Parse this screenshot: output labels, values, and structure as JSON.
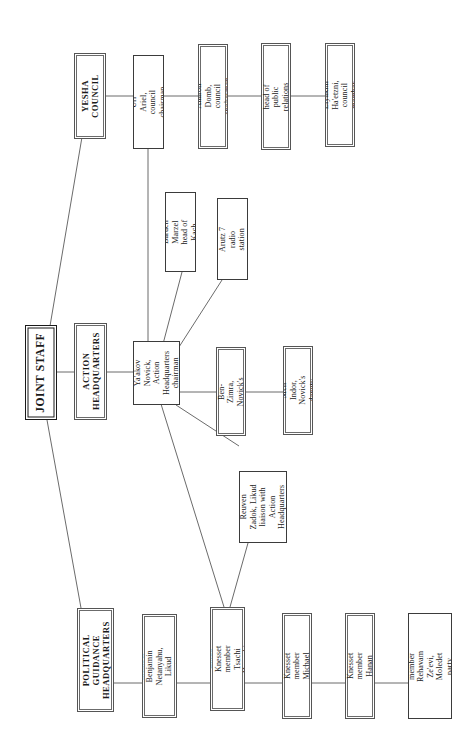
{
  "diagram": {
    "orientation": "rotated-90-ccw",
    "background_color": "#ffffff",
    "box_border_color": "#3b3b3b",
    "connector_color": "#6b6b6b"
  },
  "nodes": {
    "joint_staff": "JOINT STAFF",
    "yesha_council": "YESHA COUNCIL",
    "action_headquarters": "ACTION HEADQUARTERS",
    "political_guidance_headquarters": "POLITICAL GUIDANCE HEADQUARTERS",
    "uri_ariel": "Uri Ariel, council chairman",
    "aharon_domb": "Aharon Domb, council spokesman",
    "uri_elitsur": "Uri Elitsur, head of public relations department",
    "elyakim_haetzni": "Elyakim Ha'etzni, council member",
    "yaakov_novick": "Ya'akov Novick, Action Headquarters chairman",
    "baruch_marzel": "Baruch Marzel head of Kach",
    "arutz_7": "Arutz 7 radio station",
    "gadi_ben_zimra": "Gadi Ben-Zimra, Novick's deputy",
    "meir_indor": "Meir Indor, Novick's deputy",
    "reuven_zadok": "Reuven Zadok, Likud liaison with Action Headquarters",
    "benjamin_netanyahu": "Knesset member Benjamin Netanyahu, Likud party chairman",
    "tsachi_hanegbi": "Likud Knesset member Tsachi Hanegbi",
    "michael_eitan": "Likud Knesset member Michael Eitan",
    "hanan_porat": "NRP Knesset member Hanan Porat",
    "rehavam_zeevi": "Knesset member Rehavam Ze'evi, Moledet party chairman"
  },
  "connections": [
    {
      "from": "joint_staff",
      "to": "yesha_council",
      "style": "diagonal"
    },
    {
      "from": "joint_staff",
      "to": "action_headquarters",
      "style": "straight"
    },
    {
      "from": "joint_staff",
      "to": "political_guidance_headquarters",
      "style": "diagonal"
    },
    {
      "from": "yesha_council",
      "to": "uri_ariel",
      "style": "straight"
    },
    {
      "from": "uri_ariel",
      "to": "aharon_domb",
      "style": "straight"
    },
    {
      "from": "aharon_domb",
      "to": "uri_elitsur",
      "style": "straight"
    },
    {
      "from": "uri_elitsur",
      "to": "elyakim_haetzni",
      "style": "straight"
    },
    {
      "from": "uri_ariel",
      "to": "yaakov_novick",
      "style": "straight"
    },
    {
      "from": "action_headquarters",
      "to": "yaakov_novick",
      "style": "straight"
    },
    {
      "from": "yaakov_novick",
      "to": "baruch_marzel",
      "style": "diagonal"
    },
    {
      "from": "yaakov_novick",
      "to": "arutz_7",
      "style": "diagonal"
    },
    {
      "from": "yaakov_novick",
      "to": "gadi_ben_zimra",
      "style": "straight"
    },
    {
      "from": "gadi_ben_zimra",
      "to": "meir_indor",
      "style": "straight"
    },
    {
      "from": "yaakov_novick",
      "to": "reuven_zadok",
      "style": "diagonal"
    },
    {
      "from": "yaakov_novick",
      "to": "tsachi_hanegbi",
      "style": "diagonal"
    },
    {
      "from": "reuven_zadok",
      "to": "tsachi_hanegbi",
      "style": "diagonal"
    },
    {
      "from": "political_guidance_headquarters",
      "to": "benjamin_netanyahu",
      "style": "straight"
    },
    {
      "from": "benjamin_netanyahu",
      "to": "tsachi_hanegbi",
      "style": "straight"
    },
    {
      "from": "tsachi_hanegbi",
      "to": "michael_eitan",
      "style": "straight"
    },
    {
      "from": "michael_eitan",
      "to": "hanan_porat",
      "style": "straight"
    },
    {
      "from": "hanan_porat",
      "to": "rehavam_zeevi",
      "style": "straight"
    }
  ]
}
